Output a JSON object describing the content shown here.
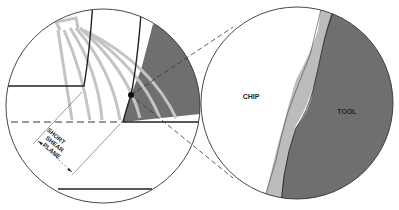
{
  "diagram": {
    "left_view": {
      "annotation_lines": [
        "SHORT",
        "SHEAR",
        "PLANE"
      ]
    },
    "right_view": {
      "chip_label": "CHIP",
      "tool_label": "TOOL"
    },
    "colors": {
      "tool_fill": "#6f6f6f",
      "interface_fill": "#bcbcbc",
      "shear_lines": "#c4c4c4",
      "outline": "#333333",
      "background": "#ffffff"
    }
  }
}
